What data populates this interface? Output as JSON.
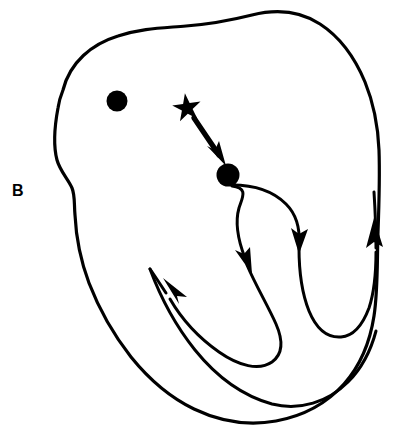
{
  "figure": {
    "panel_label": "B",
    "background_color": "#ffffff",
    "ink_color": "#000000",
    "width": 412,
    "height": 439
  },
  "markers": {
    "dot_upper_left": {
      "name": "filled-dot-marker",
      "cx": 117,
      "cy": 101,
      "r": 10.5,
      "color": "#000000"
    },
    "dot_center": {
      "name": "filled-dot-marker",
      "cx": 228,
      "cy": 175,
      "r": 11.5,
      "color": "#000000"
    },
    "star": {
      "name": "star-marker",
      "cx": 187,
      "cy": 108,
      "r_outer": 15,
      "r_inner": 5.6,
      "points": 5,
      "rotation_deg": -8,
      "color": "#000000"
    }
  },
  "pointer_arrow": {
    "label": "star-to-dot-arrow",
    "from_x": 194,
    "from_y": 119,
    "to_x": 224,
    "to_y": 163,
    "color": "#000000"
  },
  "outline": {
    "label": "region-outline",
    "stroke_width": 3.2,
    "color": "#000000",
    "closed": true
  },
  "trajectory": {
    "label": "serpentine-path",
    "stroke_width": 3.0,
    "color": "#000000",
    "arrowhead_count": 4,
    "arrowheads": [
      {
        "name": "arrowhead-down-right-upper",
        "x": 297,
        "y": 245,
        "angle_deg": 100
      },
      {
        "name": "arrowhead-down-left-inner",
        "x": 249,
        "y": 265,
        "angle_deg": 108
      },
      {
        "name": "arrowhead-up-left-lower",
        "x": 168,
        "y": 288,
        "angle_deg": -145
      },
      {
        "name": "arrowhead-up-right-outer",
        "x": 374,
        "y": 238,
        "angle_deg": -82
      }
    ]
  }
}
